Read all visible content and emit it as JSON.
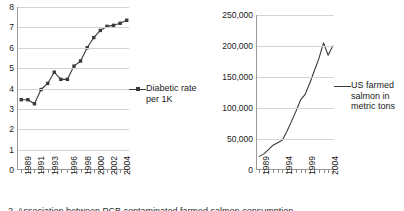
{
  "figure": {
    "caption": "2. Association between PCB contaminated farmed salmon consumption"
  },
  "chart_data": [
    {
      "type": "line",
      "title": "",
      "xlabel": "",
      "ylabel": "",
      "legend": "Diabetic rate per 1K",
      "legend_position": "right",
      "marker": "square",
      "grid": true,
      "ylim": [
        0,
        8
      ],
      "yticks": [
        "0",
        "1",
        "2",
        "3",
        "4",
        "5",
        "6",
        "7",
        "8"
      ],
      "ytick_values": [
        0,
        1,
        2,
        3,
        4,
        5,
        6,
        7,
        8
      ],
      "xticks": [
        "1989",
        "1991",
        "1993",
        "1996",
        "1998",
        "2000",
        "2002",
        "2004"
      ],
      "xtick_values": [
        1989,
        1991,
        1993,
        1996,
        1998,
        2000,
        2002,
        2004
      ],
      "x": [
        1989,
        1990,
        1991,
        1992,
        1993,
        1994,
        1995,
        1996,
        1997,
        1998,
        1999,
        2000,
        2001,
        2002,
        2003,
        2004,
        2005
      ],
      "values": [
        3.45,
        3.45,
        3.25,
        3.95,
        4.25,
        4.8,
        4.45,
        4.45,
        5.1,
        5.35,
        6.0,
        6.5,
        6.85,
        7.05,
        7.1,
        7.2,
        7.35
      ],
      "series": [
        {
          "name": "Diabetic rate per 1K",
          "values": [
            3.45,
            3.45,
            3.25,
            3.95,
            4.25,
            4.8,
            4.45,
            4.45,
            5.1,
            5.35,
            6.0,
            6.5,
            6.85,
            7.05,
            7.1,
            7.2,
            7.35
          ]
        }
      ]
    },
    {
      "type": "line",
      "title": "",
      "xlabel": "",
      "ylabel": "",
      "legend": "US farmed salmon in metric tons",
      "legend_position": "right",
      "marker": "none",
      "grid": true,
      "ylim": [
        0,
        250000
      ],
      "yticks": [
        "0",
        "50,000",
        "100,000",
        "150,000",
        "200,000",
        "250,000"
      ],
      "ytick_values": [
        0,
        50000,
        100000,
        150000,
        200000,
        250000
      ],
      "xticks": [
        "1989",
        "1994",
        "1999",
        "2004"
      ],
      "xtick_values": [
        1989,
        1994,
        1999,
        2004
      ],
      "x": [
        1989,
        1990,
        1991,
        1992,
        1993,
        1994,
        1995,
        1996,
        1997,
        1998,
        1999,
        2000,
        2001,
        2002,
        2003,
        2004,
        2005
      ],
      "values": [
        22000,
        26000,
        33000,
        40000,
        44000,
        48000,
        62000,
        78000,
        95000,
        113000,
        122000,
        140000,
        160000,
        180000,
        205000,
        185000,
        200000
      ],
      "series": [
        {
          "name": "US farmed salmon in metric tons",
          "values": [
            22000,
            26000,
            33000,
            40000,
            44000,
            48000,
            62000,
            78000,
            95000,
            113000,
            122000,
            140000,
            160000,
            180000,
            205000,
            185000,
            200000
          ]
        }
      ]
    }
  ]
}
